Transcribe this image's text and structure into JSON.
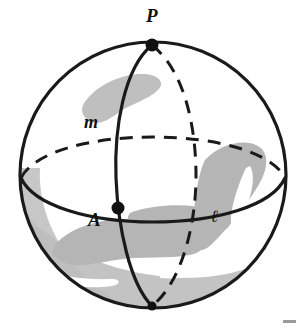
{
  "figure": {
    "background_color": "#ffffff",
    "sphere": {
      "outline_color": "#1a1a1a",
      "fill_color": "#ffffff",
      "shading_color": "#b9b9b9",
      "center_x": 153,
      "center_y": 175,
      "radius": 134,
      "outline_width": 3.2
    },
    "points": [
      {
        "name": "P",
        "label": "P",
        "dot_x": 152,
        "dot_y": 45,
        "label_x": 146,
        "label_y": 22,
        "radius": 6,
        "color": "#111111"
      },
      {
        "name": "A",
        "label": "A",
        "dot_x": 118,
        "dot_y": 208,
        "label_x": 88,
        "label_y": 226,
        "radius": 6,
        "color": "#111111"
      },
      {
        "name": "south-pole",
        "label": "",
        "dot_x": 152,
        "dot_y": 306,
        "label_x": 0,
        "label_y": 0,
        "radius": 0,
        "color": "#111111"
      }
    ],
    "curves": [
      {
        "name": "great-circle-m",
        "label": "m",
        "style": "solid",
        "label_x": 84,
        "label_y": 128
      },
      {
        "name": "great-circle-l",
        "label": "ℓ",
        "style": "solid",
        "label_x": 211,
        "label_y": 222
      },
      {
        "name": "equator-back",
        "label": "",
        "style": "dashed",
        "label_x": 0,
        "label_y": 0
      },
      {
        "name": "meridian-back",
        "label": "",
        "style": "dashed",
        "label_x": 0,
        "label_y": 0
      }
    ],
    "stroke_color": "#1a1a1a",
    "dash_pattern": "13 9",
    "corner_mark_color": "#9a9a9a"
  }
}
